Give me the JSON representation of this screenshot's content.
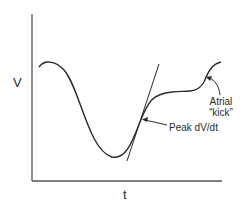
{
  "diagram": {
    "type": "pressure-time waveform schematic",
    "axes": {
      "y_label": "V",
      "x_label": "t"
    },
    "annotations": [
      {
        "id": "peak",
        "text": "Peak dV/dt"
      },
      {
        "id": "atrial",
        "line1": "Atrial",
        "line2": "“kick”"
      }
    ],
    "colors": {
      "line": "#2a2a2a",
      "axis": "#555555",
      "background": "#ffffff"
    }
  }
}
